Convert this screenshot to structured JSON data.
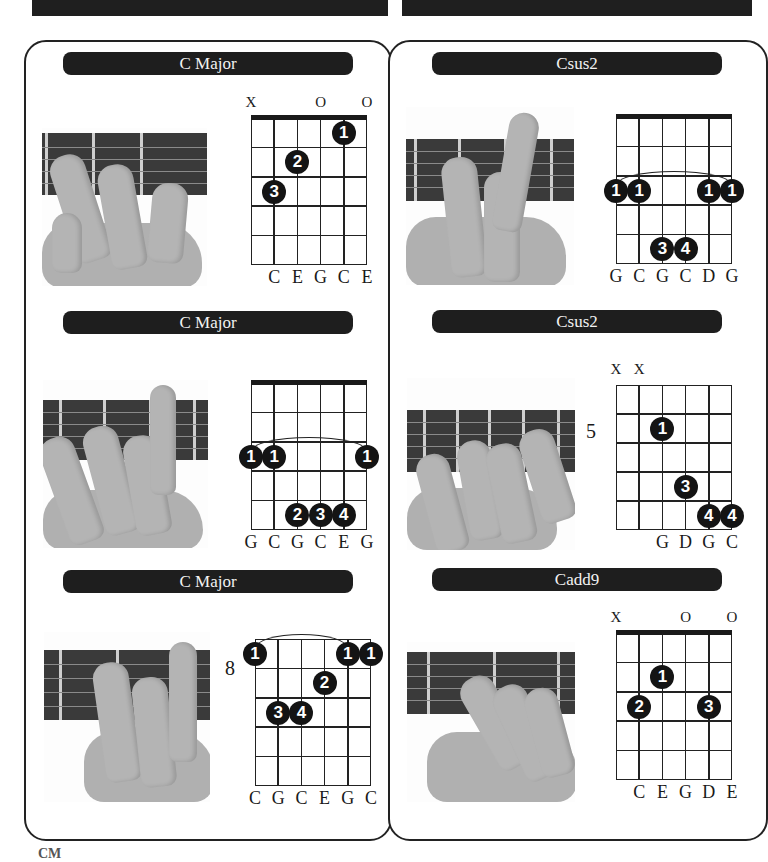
{
  "page": {
    "footer_fragment": "CM"
  },
  "colors": {
    "title_bar": "#1e1e1e",
    "title_text": "#f2f2f2",
    "dot": "#141414",
    "grid": "#222222",
    "fretboard": "#3a3a3a",
    "skin": "#b4b4b4"
  },
  "left_column": {
    "chords": [
      {
        "title": "C Major",
        "top_markers": [
          "X",
          "",
          "",
          "O",
          "",
          "O"
        ],
        "fret_number": "",
        "show_nut": true,
        "dots": [
          {
            "string": 5,
            "fret": 1,
            "finger": "1"
          },
          {
            "string": 3,
            "fret": 2,
            "finger": "2"
          },
          {
            "string": 2,
            "fret": 3,
            "finger": "3"
          }
        ],
        "barre": null,
        "notes": [
          "",
          "C",
          "E",
          "G",
          "C",
          "E"
        ]
      },
      {
        "title": "C Major",
        "top_markers": [
          "",
          "",
          "",
          "",
          "",
          ""
        ],
        "fret_number": "",
        "show_nut": true,
        "dots": [
          {
            "string": 1,
            "fret": 3,
            "finger": "1"
          },
          {
            "string": 2,
            "fret": 3,
            "finger": "1"
          },
          {
            "string": 6,
            "fret": 3,
            "finger": "1"
          },
          {
            "string": 3,
            "fret": 5,
            "finger": "2"
          },
          {
            "string": 4,
            "fret": 5,
            "finger": "3"
          },
          {
            "string": 5,
            "fret": 5,
            "finger": "4"
          }
        ],
        "barre": {
          "from": 1,
          "to": 6,
          "fret": 3
        },
        "notes": [
          "G",
          "C",
          "G",
          "C",
          "E",
          "G"
        ]
      },
      {
        "title": "C Major",
        "top_markers": [
          "",
          "",
          "",
          "",
          "",
          ""
        ],
        "fret_number": "8",
        "show_nut": false,
        "dots": [
          {
            "string": 1,
            "fret": 1,
            "finger": "1"
          },
          {
            "string": 5,
            "fret": 1,
            "finger": "1"
          },
          {
            "string": 6,
            "fret": 1,
            "finger": "1"
          },
          {
            "string": 4,
            "fret": 2,
            "finger": "2"
          },
          {
            "string": 2,
            "fret": 3,
            "finger": "3"
          },
          {
            "string": 3,
            "fret": 3,
            "finger": "4"
          }
        ],
        "barre": {
          "from": 1,
          "to": 5,
          "fret": 1
        },
        "notes": [
          "C",
          "G",
          "C",
          "E",
          "G",
          "C"
        ]
      }
    ]
  },
  "right_column": {
    "chords": [
      {
        "title": "Csus2",
        "top_markers": [
          "",
          "",
          "",
          "",
          "",
          ""
        ],
        "fret_number": "",
        "show_nut": true,
        "dots": [
          {
            "string": 1,
            "fret": 3,
            "finger": "1"
          },
          {
            "string": 2,
            "fret": 3,
            "finger": "1"
          },
          {
            "string": 5,
            "fret": 3,
            "finger": "1"
          },
          {
            "string": 6,
            "fret": 3,
            "finger": "1"
          },
          {
            "string": 3,
            "fret": 5,
            "finger": "3"
          },
          {
            "string": 4,
            "fret": 5,
            "finger": "4"
          }
        ],
        "barre": {
          "from": 1,
          "to": 6,
          "fret": 3
        },
        "notes": [
          "G",
          "C",
          "G",
          "C",
          "D",
          "G"
        ]
      },
      {
        "title": "Csus2",
        "top_markers": [
          "X",
          "X",
          "",
          "",
          "",
          ""
        ],
        "fret_number": "5",
        "show_nut": false,
        "dots": [
          {
            "string": 3,
            "fret": 2,
            "finger": "1"
          },
          {
            "string": 4,
            "fret": 4,
            "finger": "3"
          },
          {
            "string": 5,
            "fret": 5,
            "finger": "4"
          },
          {
            "string": 6,
            "fret": 5,
            "finger": "4"
          }
        ],
        "barre": null,
        "notes": [
          "",
          "",
          "G",
          "D",
          "G",
          "C"
        ]
      },
      {
        "title": "Cadd9",
        "top_markers": [
          "X",
          "",
          "",
          "O",
          "",
          "O"
        ],
        "fret_number": "",
        "show_nut": true,
        "dots": [
          {
            "string": 3,
            "fret": 2,
            "finger": "1"
          },
          {
            "string": 2,
            "fret": 3,
            "finger": "2"
          },
          {
            "string": 5,
            "fret": 3,
            "finger": "3"
          }
        ],
        "barre": null,
        "notes": [
          "",
          "C",
          "E",
          "G",
          "D",
          "E"
        ]
      }
    ]
  }
}
